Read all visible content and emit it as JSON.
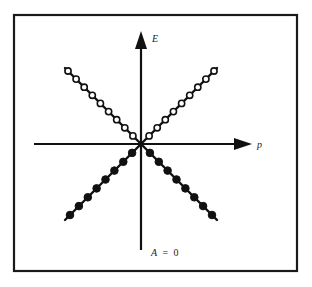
{
  "diagram": {
    "type": "energy-momentum dispersion",
    "axes": {
      "vertical_label": "E",
      "horizontal_label": "p"
    },
    "caption": {
      "symbol": "A",
      "equals": "=",
      "value": "0",
      "full": "A = 0"
    },
    "branches": [
      {
        "name": "upper-left",
        "style": "hollow-circles",
        "count": 9
      },
      {
        "name": "upper-right",
        "style": "hollow-circles",
        "count": 9
      },
      {
        "name": "lower-left",
        "style": "filled-circles",
        "count": 8
      },
      {
        "name": "lower-right",
        "style": "filled-circles",
        "count": 8
      }
    ],
    "colors": {
      "ink": "#111111",
      "background": "#ffffff"
    }
  }
}
